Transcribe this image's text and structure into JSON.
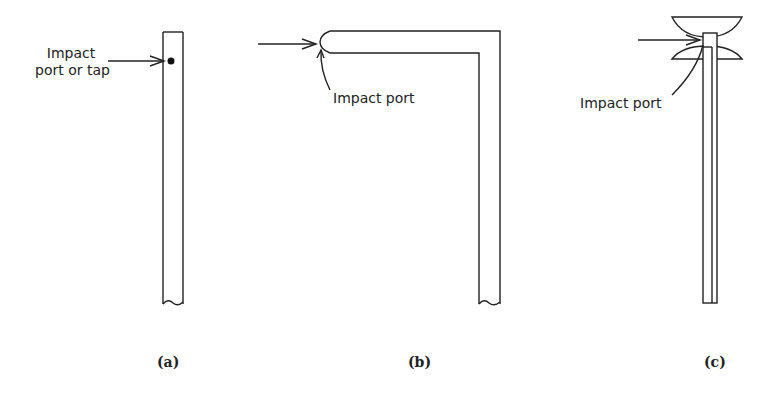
{
  "figures": [
    {
      "id": "a",
      "caption": "(a)",
      "label_line1": "Impact",
      "label_line2": "port or tap"
    },
    {
      "id": "b",
      "caption": "(b)",
      "label": "Impact port"
    },
    {
      "id": "c",
      "caption": "(c)",
      "label": "Impact port"
    }
  ]
}
